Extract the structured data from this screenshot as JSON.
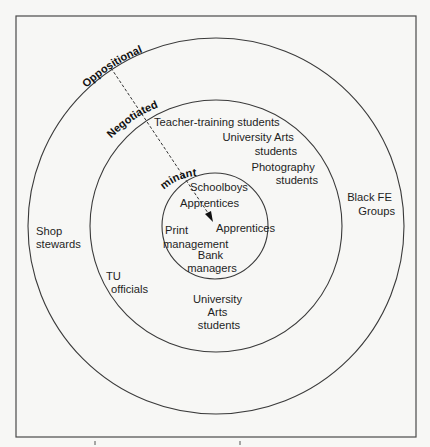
{
  "diagram": {
    "type": "concentric-circles",
    "colors": {
      "background": "#f7f7f5",
      "stroke": "#3a3a3a",
      "text": "#1e1e1e"
    },
    "rings": [
      {
        "id": "oppositional",
        "label": "Oppositional"
      },
      {
        "id": "negotiated",
        "label": "Negotiated"
      },
      {
        "id": "dominant",
        "label": "Dominant"
      }
    ],
    "arrow": {
      "style": "dashed",
      "from": "Oppositional",
      "to": "Apprentices"
    },
    "groups": {
      "dominant": {
        "schoolboys": "Schoolboys",
        "apprentices_1": "Apprentices",
        "apprentices_2": "Apprentices",
        "print_management": [
          "Print",
          "management"
        ],
        "bank_managers": [
          "Bank",
          "managers"
        ]
      },
      "negotiated": {
        "teacher_training": "Teacher-training students",
        "university_arts_top": [
          "University Arts",
          "students"
        ],
        "photography": [
          "Photography",
          "students"
        ],
        "tu_officials": [
          "TU",
          "officials"
        ],
        "university_arts_bottom": [
          "University",
          "Arts",
          "students"
        ]
      },
      "oppositional": {
        "shop_stewards": [
          "Shop",
          "stewards"
        ],
        "black_fe": [
          "Black FE",
          "Groups"
        ]
      }
    }
  }
}
